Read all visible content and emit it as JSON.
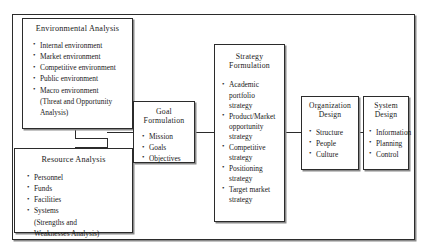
{
  "diagram": {
    "type": "flowchart",
    "nodes": {
      "environmental_analysis": {
        "title": "Environmental Analysis",
        "items": [
          {
            "text": "Internal environment",
            "bullet": true
          },
          {
            "text": "Market environment",
            "bullet": true
          },
          {
            "text": "Competitive environment",
            "bullet": true
          },
          {
            "text": "Public environment",
            "bullet": true
          },
          {
            "text": "Macro environment",
            "bullet": true
          },
          {
            "text": "(Threat and Opportunity",
            "bullet": false
          },
          {
            "text": "Analysis)",
            "bullet": false
          }
        ]
      },
      "resource_analysis": {
        "title": "Resource Analysis",
        "items": [
          {
            "text": "Personnel",
            "bullet": true
          },
          {
            "text": "Funds",
            "bullet": true
          },
          {
            "text": "Facilities",
            "bullet": true
          },
          {
            "text": "Systems",
            "bullet": true
          },
          {
            "text": "(Strengths and",
            "bullet": false
          },
          {
            "text": "Weaknesses Analysis)",
            "bullet": false
          }
        ]
      },
      "goal_formulation": {
        "title": "Goal\nFormulation",
        "title_line1": "Goal",
        "title_line2": "Formulation",
        "items": [
          {
            "text": "Mission",
            "bullet": true
          },
          {
            "text": "Goals",
            "bullet": true
          },
          {
            "text": "Objectives",
            "bullet": true
          }
        ]
      },
      "strategy_formulation": {
        "title_line1": "Strategy",
        "title_line2": "Formulation",
        "items": [
          {
            "text": "Academic",
            "bullet": true
          },
          {
            "text": "portfolio",
            "bullet": false
          },
          {
            "text": "strategy",
            "bullet": false
          },
          {
            "text": "Product/Market",
            "bullet": true
          },
          {
            "text": "opportunity",
            "bullet": false
          },
          {
            "text": "strategy",
            "bullet": false
          },
          {
            "text": "Competitive",
            "bullet": true
          },
          {
            "text": "strategy",
            "bullet": false
          },
          {
            "text": "Positioning",
            "bullet": true
          },
          {
            "text": "strategy",
            "bullet": false
          },
          {
            "text": "Target market",
            "bullet": true
          },
          {
            "text": "strategy",
            "bullet": false
          }
        ]
      },
      "organization_design": {
        "title_line1": "Organization",
        "title_line2": "Design",
        "items": [
          {
            "text": "Structure",
            "bullet": true
          },
          {
            "text": "People",
            "bullet": true
          },
          {
            "text": "Culture",
            "bullet": true
          }
        ]
      },
      "system_design": {
        "title_line1": "System",
        "title_line2": "Design",
        "items": [
          {
            "text": "Information",
            "bullet": true
          },
          {
            "text": "Planning",
            "bullet": true
          },
          {
            "text": "Control",
            "bullet": true
          }
        ]
      }
    },
    "colors": {
      "line": "#2b2b2b",
      "shadow": "#8a8a8a",
      "background": "#ffffff",
      "text": "#1a1a1a"
    }
  }
}
